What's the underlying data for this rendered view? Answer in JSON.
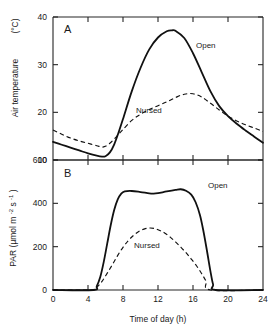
{
  "figure": {
    "panel_a_letter": "A",
    "panel_b_letter": "B",
    "xlabel": "Time of day  (h)",
    "ylabel_a_main": "Air temperature",
    "ylabel_a_unit": "(°C)",
    "ylabel_b_main": "PAR",
    "ylabel_b_unit": "(µmol m",
    "ylabel_b_exp1": "-2",
    "ylabel_b_mid": " s",
    "ylabel_b_exp2": "-1",
    "ylabel_b_close": ")",
    "label_open": "Open",
    "label_nursed": "Nursed",
    "ink_color": "#111111"
  },
  "chart_data": [
    {
      "type": "line",
      "panel": "A",
      "title": "",
      "xlabel": "Time of day (h)",
      "ylabel": "Air temperature (°C)",
      "xlim": [
        0,
        24
      ],
      "ylim": [
        10,
        40
      ],
      "xticks": [
        0,
        4,
        8,
        12,
        16,
        20,
        24
      ],
      "xticklabels": [
        "0",
        "4",
        "8",
        "12",
        "16",
        "20",
        "24"
      ],
      "yticks": [
        10,
        20,
        30,
        40
      ],
      "yticklabels": [
        "10",
        "20",
        "30",
        "40"
      ],
      "grid": false,
      "legend_position": "inline-annotations",
      "series": [
        {
          "name": "Open",
          "style": "solid",
          "x": [
            0,
            1,
            2,
            3,
            4,
            5,
            5.6,
            6,
            6.5,
            7,
            7.5,
            8,
            9,
            10,
            11,
            12,
            13,
            13.6,
            14,
            15,
            16,
            17,
            18,
            19,
            20,
            21,
            22,
            23,
            24
          ],
          "values": [
            13.8,
            13.2,
            12.6,
            12.0,
            11.4,
            10.9,
            10.7,
            10.8,
            11.6,
            13.3,
            15.8,
            18.6,
            24.4,
            29.3,
            33.2,
            35.7,
            37.0,
            37.2,
            37.1,
            35.6,
            32.4,
            28.4,
            24.4,
            21.3,
            19.2,
            17.6,
            16.2,
            14.9,
            13.6
          ]
        },
        {
          "name": "Nursed",
          "style": "dashed",
          "x": [
            0,
            1,
            2,
            3,
            4,
            5,
            5.6,
            6,
            6.5,
            7,
            7.5,
            8,
            9,
            10,
            11,
            12,
            13,
            14,
            15,
            16,
            17,
            18,
            19,
            20,
            21,
            22,
            23,
            24
          ],
          "values": [
            16.3,
            15.4,
            14.6,
            14.0,
            13.5,
            13.0,
            12.7,
            12.9,
            13.5,
            14.4,
            15.4,
            16.4,
            18.3,
            19.6,
            20.6,
            21.4,
            22.2,
            23.1,
            23.8,
            23.9,
            23.2,
            21.9,
            20.5,
            19.2,
            18.2,
            17.4,
            16.7,
            16.0
          ]
        }
      ]
    },
    {
      "type": "line",
      "panel": "B",
      "title": "",
      "xlabel": "Time of day (h)",
      "ylabel": "PAR (µmol m-2 s-1)",
      "xlim": [
        0,
        24
      ],
      "ylim": [
        0,
        600
      ],
      "xticks": [
        0,
        4,
        8,
        12,
        16,
        20,
        24
      ],
      "xticklabels": [
        "0",
        "4",
        "8",
        "12",
        "16",
        "20",
        "24"
      ],
      "yticks": [
        0,
        200,
        400,
        600
      ],
      "yticklabels": [
        "0",
        "200",
        "400",
        "600"
      ],
      "grid": false,
      "legend_position": "inline-annotations",
      "series": [
        {
          "name": "Open",
          "style": "solid",
          "x": [
            0,
            4.6,
            5.0,
            5.4,
            5.8,
            6.2,
            6.6,
            7.0,
            7.4,
            7.8,
            8.2,
            9,
            10,
            11,
            11.5,
            12,
            13,
            14,
            14.6,
            15.2,
            15.8,
            16.3,
            16.8,
            17.2,
            17.6,
            18.0,
            18.3,
            18.6,
            24
          ],
          "values": [
            0,
            0,
            18,
            60,
            130,
            215,
            300,
            370,
            418,
            445,
            455,
            457,
            452,
            446,
            445,
            447,
            455,
            462,
            465,
            458,
            440,
            405,
            345,
            270,
            180,
            85,
            25,
            0,
            0
          ]
        },
        {
          "name": "Nursed",
          "style": "dashed",
          "x": [
            0,
            4.5,
            5.0,
            5.6,
            6.2,
            6.8,
            7.4,
            8.0,
            8.6,
            9.2,
            9.8,
            10.4,
            11.0,
            11.6,
            12.2,
            12.8,
            13.4,
            14.0,
            14.6,
            15.2,
            15.8,
            16.4,
            17.0,
            17.5,
            18.0,
            24
          ],
          "values": [
            0,
            0,
            12,
            40,
            78,
            118,
            160,
            197,
            228,
            252,
            270,
            281,
            286,
            284,
            275,
            262,
            244,
            222,
            198,
            172,
            143,
            112,
            75,
            40,
            0,
            0
          ]
        }
      ]
    }
  ]
}
